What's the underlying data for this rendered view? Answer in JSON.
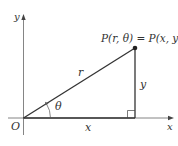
{
  "diagram": {
    "labels": {
      "point": "P(r, θ) = P(x, y)",
      "radius": "r",
      "angle": "θ",
      "adjacent": "x",
      "opposite": "y",
      "origin": "O",
      "x_axis": "x",
      "y_axis": "y"
    },
    "colors": {
      "axis": "#555555",
      "line": "#333333",
      "text": "#333333"
    }
  }
}
